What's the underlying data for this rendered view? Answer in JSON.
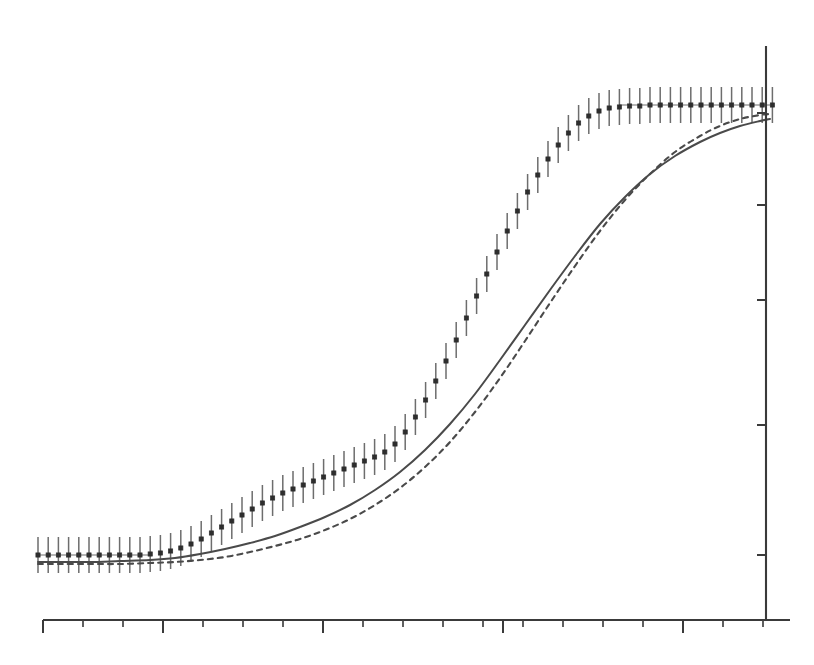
{
  "figure": {
    "background_color": "#ffffff",
    "ink_color": "#3a3a3a",
    "marker_color": "#2e2e2e",
    "errorbar_color": "#6d6d6d",
    "curve_color": "#4a4a4a"
  },
  "chart_data": {
    "type": "line",
    "title": "",
    "subtitle": "",
    "xlabel": "",
    "ylabel": "",
    "grid": false,
    "legend": null,
    "annotations": [],
    "axes": {
      "x_axis": {
        "position": "bottom",
        "pixel_y": 620,
        "pixel_x_start": 43,
        "pixel_x_end": 790,
        "range": [
          0,
          100
        ],
        "tick_labels": [],
        "minor_tick_pixels": [
          43,
          83,
          123,
          163,
          203,
          243,
          283,
          323,
          363,
          403,
          443,
          483,
          523,
          563,
          603,
          643,
          683,
          723,
          763
        ],
        "major_tick_pixels": [
          43,
          163,
          323,
          503,
          683
        ],
        "tick_direction": "down",
        "minor_tick_length": 7,
        "major_tick_length": 13
      },
      "y_axis": {
        "position": "right",
        "pixel_x": 766,
        "pixel_y_top": 46,
        "pixel_y_bottom": 620,
        "range": [
          0,
          100
        ],
        "tick_labels": [],
        "tick_pixels": [
          113,
          205,
          300,
          425,
          555
        ],
        "tick_direction": "left",
        "tick_length": 9
      }
    },
    "series": [
      {
        "name": "measured-data",
        "style": "points-with-error-bars",
        "marker": "filled-square",
        "color": "#2e2e2e",
        "errorbar_color": "#6d6d6d",
        "x_start_pixel": 38,
        "x_spacing_pixel": 10.2,
        "errorbar_half_height_pixel": 18,
        "y_pixels": [
          555,
          555,
          555,
          555,
          555,
          555,
          555,
          555,
          555,
          555,
          555,
          554,
          553,
          551,
          548,
          544,
          539,
          533,
          527,
          521,
          515,
          509,
          503,
          498,
          493,
          489,
          485,
          481,
          477,
          473,
          469,
          465,
          461,
          457,
          452,
          444,
          432,
          417,
          400,
          381,
          361,
          340,
          318,
          296,
          274,
          252,
          231,
          211,
          192,
          175,
          159,
          145,
          133,
          123,
          116,
          111,
          108,
          107,
          106,
          106,
          105,
          105,
          105,
          105,
          105,
          105,
          105,
          105,
          105,
          105,
          105,
          105,
          105
        ]
      },
      {
        "name": "model-fit-solid",
        "style": "solid-line",
        "color": "#4a4a4a",
        "points_pixel": [
          [
            38,
            562
          ],
          [
            60,
            562
          ],
          [
            90,
            562
          ],
          [
            120,
            561
          ],
          [
            150,
            560
          ],
          [
            175,
            558
          ],
          [
            200,
            554
          ],
          [
            225,
            549
          ],
          [
            250,
            543
          ],
          [
            275,
            536
          ],
          [
            300,
            527
          ],
          [
            325,
            517
          ],
          [
            350,
            505
          ],
          [
            375,
            490
          ],
          [
            400,
            472
          ],
          [
            425,
            450
          ],
          [
            450,
            424
          ],
          [
            475,
            394
          ],
          [
            500,
            360
          ],
          [
            525,
            325
          ],
          [
            550,
            290
          ],
          [
            575,
            256
          ],
          [
            600,
            224
          ],
          [
            625,
            197
          ],
          [
            650,
            174
          ],
          [
            675,
            156
          ],
          [
            700,
            142
          ],
          [
            720,
            133
          ],
          [
            740,
            126
          ],
          [
            760,
            121
          ],
          [
            770,
            119
          ]
        ]
      },
      {
        "name": "model-fit-dashed",
        "style": "dashed-line",
        "color": "#4a4a4a",
        "points_pixel": [
          [
            38,
            564
          ],
          [
            60,
            564
          ],
          [
            90,
            564
          ],
          [
            120,
            564
          ],
          [
            150,
            563
          ],
          [
            175,
            562
          ],
          [
            200,
            560
          ],
          [
            225,
            557
          ],
          [
            250,
            552
          ],
          [
            275,
            546
          ],
          [
            300,
            539
          ],
          [
            325,
            530
          ],
          [
            350,
            519
          ],
          [
            375,
            505
          ],
          [
            400,
            488
          ],
          [
            425,
            467
          ],
          [
            450,
            442
          ],
          [
            475,
            412
          ],
          [
            500,
            378
          ],
          [
            525,
            341
          ],
          [
            550,
            303
          ],
          [
            575,
            266
          ],
          [
            600,
            231
          ],
          [
            625,
            200
          ],
          [
            650,
            174
          ],
          [
            675,
            152
          ],
          [
            700,
            136
          ],
          [
            720,
            126
          ],
          [
            740,
            119
          ],
          [
            760,
            115
          ],
          [
            770,
            114
          ]
        ]
      }
    ]
  }
}
